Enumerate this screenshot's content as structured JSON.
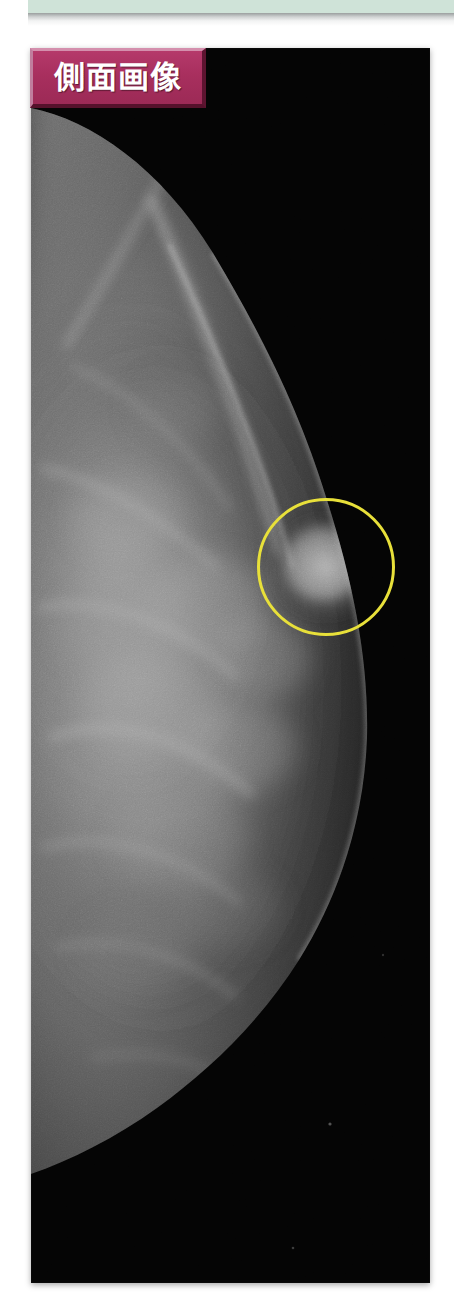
{
  "page": {
    "background_color": "#ffffff",
    "width": 454,
    "height": 1295
  },
  "top_bar": {
    "name": "decorative-header-band",
    "color": "#cfe3d8",
    "shadow_color": "#787e7e"
  },
  "image_panel": {
    "name": "mammogram-panel",
    "background_color": "#050505",
    "left": 31,
    "top": 48,
    "width": 399,
    "height": 1235,
    "modality": "mammography",
    "view": "lateral"
  },
  "view_badge": {
    "label": "側面画像",
    "background_color": "#a82f5e",
    "text_color": "#ffffff",
    "bevel_light": "#d48fad",
    "bevel_dark": "#55112b"
  },
  "annotation": {
    "type": "circle",
    "name": "lesion-roi-circle",
    "color": "#e8e03a",
    "stroke_width": 3,
    "center_x": 326,
    "center_y": 567,
    "radius": 69
  },
  "chart_data": {
    "type": "heatmap",
    "title": "側面画像",
    "xlabel": "",
    "ylabel": "",
    "intensity_scale": [
      "#000000",
      "#2a2a2a",
      "#585858",
      "#8a8a8a",
      "#c8c8c8",
      "#ffffff"
    ],
    "regions": [
      {
        "name": "background-air",
        "intensity": 0.02,
        "x": 0.72,
        "y": 0.5
      },
      {
        "name": "pectoral-muscle-edge",
        "intensity": 0.28,
        "x": 0.26,
        "y": 0.12
      },
      {
        "name": "fibroglandular-tissue",
        "intensity": 0.45,
        "x": 0.34,
        "y": 0.52
      },
      {
        "name": "dense-core",
        "intensity": 0.58,
        "x": 0.4,
        "y": 0.48
      },
      {
        "name": "suspicious-mass",
        "intensity": 0.62,
        "x": 0.74,
        "y": 0.42
      },
      {
        "name": "fatty-tissue",
        "intensity": 0.2,
        "x": 0.18,
        "y": 0.7
      },
      {
        "name": "inframammary-fold",
        "intensity": 0.15,
        "x": 0.25,
        "y": 0.83
      }
    ],
    "legend_position": "none",
    "grid": false
  }
}
